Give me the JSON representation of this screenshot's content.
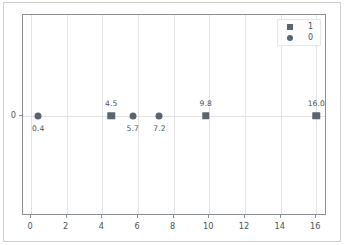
{
  "chart_data": {
    "type": "scatter",
    "title": "",
    "xlabel": "",
    "ylabel": "",
    "xlim": [
      -0.45,
      16.6
    ],
    "ylim": [
      -1,
      1
    ],
    "grid": true,
    "legend_position": "upper right",
    "xticks": [
      "0",
      "2",
      "4",
      "6",
      "8",
      "10",
      "12",
      "14",
      "16"
    ],
    "xtick_values": [
      0,
      2,
      4,
      6,
      8,
      10,
      12,
      14,
      16
    ],
    "yticks": [
      "0"
    ],
    "ytick_values": [
      0
    ],
    "series": [
      {
        "name": "1",
        "marker": "square",
        "color": "#596570",
        "label_position": "above",
        "points": [
          {
            "x": 4.5,
            "y": 0,
            "label": "4.5"
          },
          {
            "x": 9.8,
            "y": 0,
            "label": "9.8"
          },
          {
            "x": 16.0,
            "y": 0,
            "label": "16.0"
          }
        ]
      },
      {
        "name": "0",
        "marker": "circle",
        "color": "#596570",
        "label_position": "below",
        "points": [
          {
            "x": 0.4,
            "y": 0,
            "label": "0.4"
          },
          {
            "x": 5.7,
            "y": 0,
            "label": "5.7"
          },
          {
            "x": 7.2,
            "y": 0,
            "label": "7.2"
          }
        ]
      }
    ],
    "legend": [
      {
        "label": "1",
        "marker": "square"
      },
      {
        "label": "0",
        "marker": "circle"
      }
    ]
  },
  "colors": {
    "marker": "#596570",
    "gridline": "#e2e3e5",
    "axis_frame": "#8a8f96",
    "text": "#4c545c",
    "figure_border": "#cfcfcf",
    "background": "#ffffff"
  }
}
